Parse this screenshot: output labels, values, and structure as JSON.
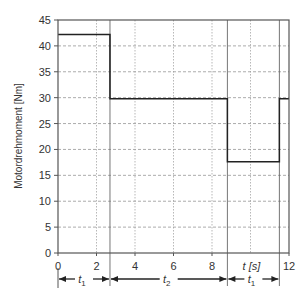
{
  "chart_data": {
    "type": "line",
    "title": "",
    "xlabel": "t [s]",
    "ylabel": "Motordrehmoment  [Nm]",
    "xlim": [
      0,
      12
    ],
    "ylim": [
      0,
      45
    ],
    "x_ticks": [
      0,
      2,
      4,
      6,
      8,
      12
    ],
    "x_tick_labels": [
      "0",
      "2",
      "4",
      "6",
      "8",
      "12"
    ],
    "y_ticks": [
      0,
      5,
      10,
      15,
      20,
      25,
      30,
      35,
      40,
      45
    ],
    "y_tick_labels": [
      "0",
      "5",
      "10",
      "15",
      "20",
      "25",
      "30",
      "35",
      "40",
      "45"
    ],
    "grid": true,
    "series": [
      {
        "name": "Motordrehmoment",
        "step": true,
        "x": [
          0,
          2.7,
          2.7,
          8.8,
          8.8,
          11.5,
          11.5,
          12
        ],
        "y": [
          42.2,
          42.2,
          29.8,
          29.8,
          17.6,
          17.6,
          29.8,
          29.8
        ]
      }
    ],
    "phase_markers": [
      2.7,
      8.8,
      11.5
    ],
    "intervals": [
      {
        "label": "t",
        "sub": "1",
        "from": 0,
        "to": 2.7
      },
      {
        "label": "t",
        "sub": "2",
        "from": 2.7,
        "to": 8.8
      },
      {
        "label": "t",
        "sub": "1",
        "from": 8.8,
        "to": 11.5
      }
    ]
  }
}
